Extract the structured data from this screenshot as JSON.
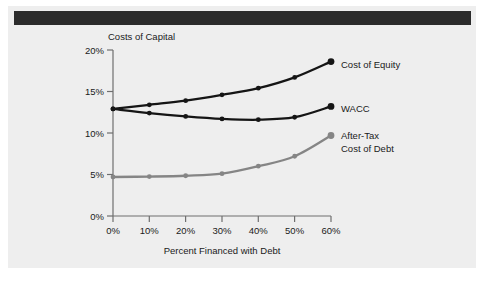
{
  "figure": {
    "background_color": "#eeeeee",
    "header_bar_color": "#2b2b2b"
  },
  "chart_data": {
    "type": "line",
    "title": "",
    "xlabel": "Percent Financed with Debt",
    "ylabel": "Costs of Capital",
    "x": [
      0,
      10,
      20,
      30,
      40,
      50,
      60
    ],
    "xtick_labels": [
      "0%",
      "10%",
      "20%",
      "30%",
      "40%",
      "50%",
      "60%"
    ],
    "ytick_labels": [
      "0%",
      "5%",
      "10%",
      "15%",
      "20%"
    ],
    "ytick_values": [
      0,
      5,
      10,
      15,
      20
    ],
    "xlim": [
      0,
      60
    ],
    "ylim": [
      0,
      20
    ],
    "grid": false,
    "legend_position": "right-inline-labels",
    "series": [
      {
        "name": "Cost of Equity",
        "color": "#151515",
        "values": [
          12.9,
          13.4,
          13.9,
          14.6,
          15.4,
          16.7,
          18.6
        ]
      },
      {
        "name": "WACC",
        "color": "#151515",
        "values": [
          12.9,
          12.4,
          12.0,
          11.7,
          11.6,
          11.9,
          13.2
        ]
      },
      {
        "name": "After-Tax Cost of Debt",
        "color": "#858585",
        "values": [
          4.7,
          4.75,
          4.85,
          5.1,
          6.0,
          7.2,
          9.7
        ]
      }
    ],
    "annotations": [
      {
        "text": "Cost of Equity",
        "series": "Cost of Equity"
      },
      {
        "text": "WACC",
        "series": "WACC"
      },
      {
        "text": "After-Tax",
        "series": "After-Tax Cost of Debt"
      },
      {
        "text": "Cost of Debt",
        "series": "After-Tax Cost of Debt"
      }
    ]
  },
  "labels": {
    "y_axis_title": "Costs of Capital",
    "x_axis_title": "Percent Financed with Debt",
    "series_equity": "Cost of Equity",
    "series_wacc": "WACC",
    "series_debt_line1": "After-Tax",
    "series_debt_line2": "Cost of Debt",
    "ytick_20": "20%",
    "ytick_15": "15%",
    "ytick_10": "10%",
    "ytick_5": "5%",
    "ytick_0": "0%",
    "xtick_0": "0%",
    "xtick_10": "10%",
    "xtick_20": "20%",
    "xtick_30": "30%",
    "xtick_40": "40%",
    "xtick_50": "50%",
    "xtick_60": "60%"
  }
}
